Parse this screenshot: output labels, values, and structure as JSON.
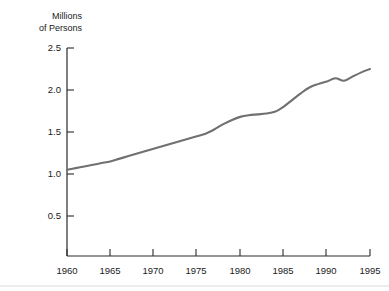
{
  "chart_data": {
    "type": "line",
    "title": "",
    "subtitle": "",
    "ylabel_line1": "Millions",
    "ylabel_line2": "of Persons",
    "xlabel": "",
    "grid": false,
    "legend": false,
    "legend_position": "none",
    "line_color": "#707070",
    "axis_color": "#2b2b2b",
    "xlim": [
      1960,
      1995
    ],
    "ylim": [
      0.0,
      2.5
    ],
    "xticks": [
      1960,
      1965,
      1970,
      1975,
      1980,
      1985,
      1990,
      1995
    ],
    "xtick_labels": [
      "1960",
      "1965",
      "1970",
      "1975",
      "1980",
      "1985",
      "1990",
      "1995"
    ],
    "yticks": [
      0.5,
      1.0,
      1.5,
      2.0,
      2.5
    ],
    "ytick_labels": [
      "0.5",
      "1.0",
      "1.5",
      "2.0",
      "2.5"
    ],
    "x": [
      1960,
      1961,
      1962,
      1963,
      1964,
      1965,
      1966,
      1967,
      1968,
      1969,
      1970,
      1971,
      1972,
      1973,
      1974,
      1975,
      1976,
      1977,
      1978,
      1979,
      1980,
      1981,
      1982,
      1983,
      1984,
      1985,
      1986,
      1987,
      1988,
      1989,
      1990,
      1991,
      1992,
      1993,
      1994,
      1995
    ],
    "values": [
      1.05,
      1.07,
      1.09,
      1.11,
      1.13,
      1.15,
      1.18,
      1.21,
      1.24,
      1.27,
      1.3,
      1.33,
      1.36,
      1.39,
      1.42,
      1.45,
      1.48,
      1.53,
      1.59,
      1.64,
      1.68,
      1.7,
      1.71,
      1.72,
      1.74,
      1.8,
      1.88,
      1.96,
      2.03,
      2.07,
      2.1,
      2.14,
      2.11,
      2.16,
      2.21,
      2.25
    ],
    "series": [
      {
        "name": "Millions of Persons",
        "values": [
          1.05,
          1.07,
          1.09,
          1.11,
          1.13,
          1.15,
          1.18,
          1.21,
          1.24,
          1.27,
          1.3,
          1.33,
          1.36,
          1.39,
          1.42,
          1.45,
          1.48,
          1.53,
          1.59,
          1.64,
          1.68,
          1.7,
          1.71,
          1.72,
          1.74,
          1.8,
          1.88,
          1.96,
          2.03,
          2.07,
          2.1,
          2.14,
          2.11,
          2.16,
          2.21,
          2.25
        ]
      }
    ],
    "annotations": []
  }
}
